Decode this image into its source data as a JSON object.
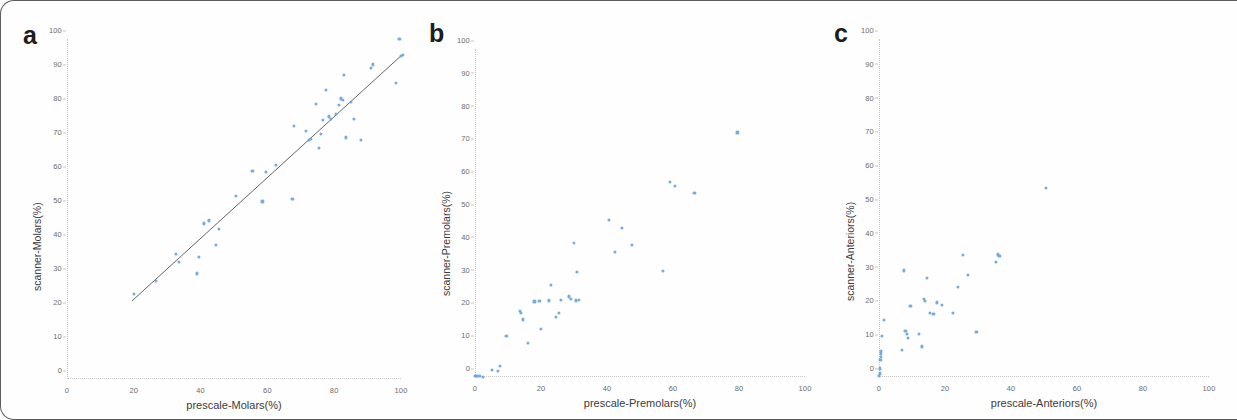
{
  "figure": {
    "marker_color": "#6fa8dc",
    "fit_line_color": "#555555",
    "axis_color": "#c6c6c6"
  },
  "panels": [
    {
      "letter": "a",
      "xlabel": "prescale-Molars(%)",
      "ylabel": "scanner-Molars(%)"
    },
    {
      "letter": "b",
      "xlabel": "prescale-Premolars(%)",
      "ylabel": "scanner-Premolars(%)"
    },
    {
      "letter": "c",
      "xlabel": "prescale-Anteriors(%)",
      "ylabel": "scanner-Anteriors(%)"
    }
  ],
  "chart_data": [
    {
      "type": "scatter",
      "panel": "a",
      "title": "",
      "xlabel": "prescale-Molars(%)",
      "ylabel": "scanner-Molars(%)",
      "xlim": [
        0,
        100
      ],
      "ylim": [
        0,
        100
      ],
      "xticks": [
        0,
        20,
        40,
        60,
        80,
        100
      ],
      "yticks": [
        0,
        10,
        20,
        30,
        40,
        50,
        60,
        70,
        80,
        90,
        100
      ],
      "grid": false,
      "legend": null,
      "fit_line": {
        "x": [
          19.5,
          100.5
        ],
        "y": [
          23.0,
          95.5
        ]
      },
      "points": [
        [
          20.0,
          25.0
        ],
        [
          26.5,
          28.8
        ],
        [
          32.5,
          36.8
        ],
        [
          33.5,
          34.5
        ],
        [
          39.0,
          31.0
        ],
        [
          39.5,
          35.8
        ],
        [
          41.0,
          45.7
        ],
        [
          42.5,
          46.6
        ],
        [
          44.5,
          39.5
        ],
        [
          45.5,
          44.2
        ],
        [
          50.5,
          53.8
        ],
        [
          55.5,
          61.2
        ],
        [
          58.5,
          52.2
        ],
        [
          59.5,
          60.8
        ],
        [
          62.5,
          63.0
        ],
        [
          67.5,
          53.0
        ],
        [
          68.0,
          74.5
        ],
        [
          71.5,
          73.0
        ],
        [
          72.5,
          70.2
        ],
        [
          73.0,
          70.5
        ],
        [
          74.5,
          80.8
        ],
        [
          75.5,
          67.8
        ],
        [
          76.0,
          72.0
        ],
        [
          76.5,
          76.2
        ],
        [
          77.5,
          85.0
        ],
        [
          78.5,
          77.2
        ],
        [
          79.0,
          76.5
        ],
        [
          80.5,
          78.0
        ],
        [
          81.5,
          80.5
        ],
        [
          82.0,
          82.5
        ],
        [
          82.5,
          82.0
        ],
        [
          83.0,
          89.3
        ],
        [
          83.5,
          71.0
        ],
        [
          85.0,
          81.5
        ],
        [
          86.0,
          76.5
        ],
        [
          88.0,
          70.2
        ],
        [
          91.0,
          91.5
        ],
        [
          91.5,
          92.5
        ],
        [
          98.5,
          87.0
        ],
        [
          99.5,
          100.0
        ],
        [
          100.0,
          95.0
        ],
        [
          100.5,
          95.2
        ]
      ]
    },
    {
      "type": "scatter",
      "panel": "b",
      "title": "",
      "xlabel": "prescale-Premolars(%)",
      "ylabel": "scanner-Premolars(%)",
      "xlim": [
        0,
        100
      ],
      "ylim": [
        0,
        100
      ],
      "xticks": [
        0,
        20,
        40,
        60,
        80,
        100
      ],
      "yticks": [
        0,
        10,
        20,
        30,
        40,
        50,
        60,
        70,
        80,
        90,
        100
      ],
      "grid": false,
      "legend": null,
      "fit_line": null,
      "points": [
        [
          0.0,
          0.3
        ],
        [
          0.3,
          0.3
        ],
        [
          0.6,
          0.4
        ],
        [
          1.0,
          0.3
        ],
        [
          1.4,
          0.4
        ],
        [
          2.5,
          0.0
        ],
        [
          5.0,
          2.0
        ],
        [
          7.0,
          1.8
        ],
        [
          7.5,
          3.3
        ],
        [
          9.5,
          12.5
        ],
        [
          13.5,
          20.2
        ],
        [
          14.0,
          19.5
        ],
        [
          14.5,
          17.5
        ],
        [
          16.0,
          10.3
        ],
        [
          18.0,
          23.0
        ],
        [
          19.5,
          23.2
        ],
        [
          20.0,
          14.5
        ],
        [
          22.5,
          23.3
        ],
        [
          23.0,
          28.0
        ],
        [
          24.5,
          18.2
        ],
        [
          25.5,
          19.5
        ],
        [
          26.0,
          23.5
        ],
        [
          28.5,
          24.5
        ],
        [
          29.0,
          23.8
        ],
        [
          30.0,
          40.8
        ],
        [
          30.5,
          23.3
        ],
        [
          31.0,
          32.0
        ],
        [
          31.5,
          23.5
        ],
        [
          40.5,
          47.8
        ],
        [
          42.5,
          38.2
        ],
        [
          44.5,
          45.5
        ],
        [
          47.5,
          40.3
        ],
        [
          57.0,
          32.2
        ],
        [
          59.0,
          59.5
        ],
        [
          60.5,
          58.3
        ],
        [
          66.5,
          56.0
        ],
        [
          79.5,
          74.5
        ]
      ]
    },
    {
      "type": "scatter",
      "panel": "c",
      "title": "",
      "xlabel": "prescale-Anteriors(%)",
      "ylabel": "scanner-Anteriors(%)",
      "xlim": [
        0,
        100
      ],
      "ylim": [
        0,
        100
      ],
      "xticks": [
        0,
        20,
        40,
        60,
        80,
        100
      ],
      "yticks": [
        0,
        10,
        20,
        30,
        40,
        50,
        60,
        70,
        80,
        90,
        100
      ],
      "grid": false,
      "legend": null,
      "fit_line": null,
      "points": [
        [
          0.0,
          0.3
        ],
        [
          0.2,
          1.0
        ],
        [
          0.3,
          2.5
        ],
        [
          0.4,
          5.0
        ],
        [
          0.5,
          6.0
        ],
        [
          0.6,
          6.8
        ],
        [
          0.7,
          7.5
        ],
        [
          1.0,
          12.0
        ],
        [
          1.5,
          16.8
        ],
        [
          7.0,
          8.0
        ],
        [
          7.5,
          31.5
        ],
        [
          8.0,
          13.5
        ],
        [
          8.5,
          12.8
        ],
        [
          8.8,
          11.5
        ],
        [
          9.5,
          21.0
        ],
        [
          12.0,
          12.8
        ],
        [
          13.0,
          9.0
        ],
        [
          13.5,
          23.0
        ],
        [
          14.0,
          22.5
        ],
        [
          14.5,
          29.3
        ],
        [
          15.5,
          19.0
        ],
        [
          16.5,
          18.5
        ],
        [
          17.5,
          22.0
        ],
        [
          19.0,
          21.3
        ],
        [
          22.5,
          19.0
        ],
        [
          24.0,
          26.5
        ],
        [
          25.5,
          36.0
        ],
        [
          27.0,
          30.2
        ],
        [
          29.5,
          13.2
        ],
        [
          35.5,
          34.0
        ],
        [
          36.0,
          36.2
        ],
        [
          36.5,
          35.8
        ],
        [
          50.5,
          55.8
        ]
      ]
    }
  ]
}
